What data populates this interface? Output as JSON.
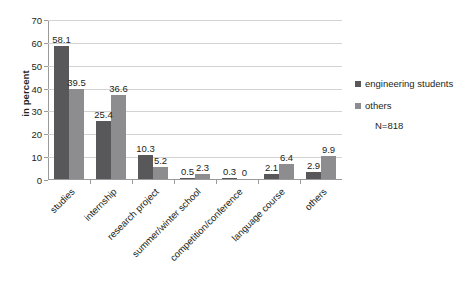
{
  "chart_data": {
    "type": "bar",
    "title": "",
    "xlabel": "",
    "ylabel": "in percent",
    "ylim": [
      0,
      70
    ],
    "yticks": [
      0,
      10,
      20,
      30,
      40,
      50,
      60,
      70
    ],
    "grid": true,
    "legend_position": "right",
    "categories": [
      "studies",
      "internship",
      "research project",
      "summer/winter school",
      "competition/conference",
      "language course",
      "others"
    ],
    "series": [
      {
        "name": "engineering students",
        "color": "#58585a",
        "values": [
          58.1,
          25.4,
          10.3,
          0.5,
          0.3,
          2.1,
          2.9
        ],
        "labels": [
          "58.1",
          "25.4",
          "10.3",
          "0.5",
          "0.3",
          "2.1",
          "2.9"
        ]
      },
      {
        "name": "others",
        "color": "#8d8d8f",
        "values": [
          39.5,
          36.6,
          5.2,
          2.3,
          0,
          6.4,
          9.9
        ],
        "labels": [
          "39.5",
          "36.6",
          "5.2",
          "2.3",
          "0",
          "6.4",
          "9.9"
        ]
      }
    ],
    "annotations": [
      "N=818"
    ]
  },
  "legend": {
    "items": [
      {
        "label": "engineering students",
        "color": "#58585a"
      },
      {
        "label": "others",
        "color": "#8d8d8f"
      }
    ]
  },
  "annotation": {
    "sample_size": "N=818"
  },
  "axes": {
    "y_title": "in percent",
    "y_tick_labels": [
      "70",
      "60",
      "50",
      "40",
      "30",
      "20",
      "10",
      "0"
    ],
    "x_tick_labels": [
      "studies",
      "internship",
      "research project",
      "summer/winter school",
      "competition/conference",
      "language course",
      "others"
    ]
  }
}
